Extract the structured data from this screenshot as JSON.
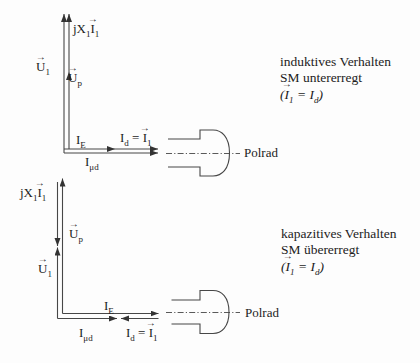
{
  "figure": {
    "background": "#fdfdfd",
    "line_color": "#474747",
    "text_color": "#1c1c1c"
  },
  "symbols": {
    "vector_arrow": "→"
  },
  "top": {
    "caption": {
      "line1": "induktives Verhalten",
      "line2": "SM untererregt",
      "line3": [
        [
          "t",
          "("
        ],
        [
          "v",
          "I"
        ],
        [
          "s",
          "1"
        ],
        [
          "t",
          " = "
        ],
        [
          "t",
          "I"
        ],
        [
          "s",
          "d"
        ],
        [
          "t",
          ")"
        ]
      ]
    },
    "labels": {
      "jx1i1": [
        [
          "t",
          "jX"
        ],
        [
          "s",
          "1"
        ],
        [
          "v",
          "I"
        ],
        [
          "s",
          "1"
        ]
      ],
      "u1": [
        [
          "v",
          "U"
        ],
        [
          "s",
          "1"
        ]
      ],
      "up": [
        [
          "v",
          "U"
        ],
        [
          "s",
          "p"
        ]
      ],
      "ie": [
        [
          "t",
          "I"
        ],
        [
          "s",
          "E"
        ]
      ],
      "id_i1": [
        [
          "t",
          "I"
        ],
        [
          "s",
          "d"
        ],
        [
          "t",
          " = "
        ],
        [
          "v",
          "I"
        ],
        [
          "s",
          "1"
        ]
      ],
      "imud": [
        [
          "t",
          "I"
        ],
        [
          "s",
          "μd"
        ]
      ],
      "polrad": "Polrad"
    }
  },
  "bottom": {
    "caption": {
      "line1": "kapazitives Verhalten",
      "line2": "SM übererregt",
      "line3": [
        [
          "t",
          "("
        ],
        [
          "v",
          "I"
        ],
        [
          "s",
          "1"
        ],
        [
          "t",
          " = "
        ],
        [
          "t",
          "I"
        ],
        [
          "s",
          "d"
        ],
        [
          "t",
          ")"
        ]
      ]
    },
    "labels": {
      "jx1i1": [
        [
          "t",
          "jX"
        ],
        [
          "s",
          "1"
        ],
        [
          "v",
          "I"
        ],
        [
          "s",
          "1"
        ]
      ],
      "u1": [
        [
          "v",
          "U"
        ],
        [
          "s",
          "1"
        ]
      ],
      "up": [
        [
          "v",
          "U"
        ],
        [
          "s",
          "p"
        ]
      ],
      "ie": [
        [
          "t",
          "I"
        ],
        [
          "s",
          "E"
        ]
      ],
      "id_i1": [
        [
          "t",
          "I"
        ],
        [
          "s",
          "d"
        ],
        [
          "t",
          " = "
        ],
        [
          "v",
          "I"
        ],
        [
          "s",
          "1"
        ]
      ],
      "imud": [
        [
          "t",
          "I"
        ],
        [
          "s",
          "μd"
        ]
      ],
      "polrad": "Polrad"
    }
  }
}
